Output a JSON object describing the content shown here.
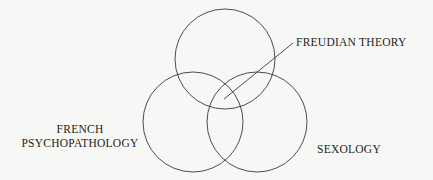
{
  "canvas": {
    "width": 433,
    "height": 180,
    "background_color": "#f7f7f5",
    "stroke_color": "#3a3a3e"
  },
  "labels": {
    "freudian_theory": "FREUDIAN THEORY",
    "french_line1": "FRENCH",
    "french_line2": "PSYCHOPATHOLOGY",
    "sexology": "SEXOLOGY"
  },
  "chart_data": {
    "type": "diagram",
    "diagram_type": "venn",
    "title": "",
    "set_count": 3,
    "sets": [
      {
        "name": "FREUDIAN THEORY",
        "label_position": "top-right-external",
        "center_x": 225,
        "center_y": 59,
        "radius": 50,
        "leader_line": true
      },
      {
        "name": "FRENCH PSYCHOPATHOLOGY",
        "label_position": "left-external",
        "center_x": 193,
        "center_y": 122,
        "radius": 50,
        "leader_line": false
      },
      {
        "name": "SEXOLOGY",
        "label_position": "right-external",
        "center_x": 257,
        "center_y": 122,
        "radius": 50,
        "leader_line": false
      }
    ],
    "leader_lines": [
      {
        "label": "FREUDIAN THEORY",
        "from_x": 224,
        "from_y": 99,
        "to_x": 293,
        "to_y": 43,
        "points_to": "central-intersection"
      }
    ],
    "annotations": [],
    "legend": "none",
    "grid": false,
    "fill": "none",
    "stroke_width": 0.9
  }
}
